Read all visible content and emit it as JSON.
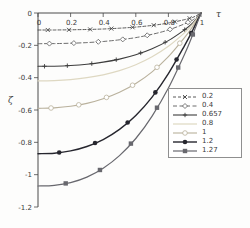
{
  "figure": {
    "background": "#fdfdfc",
    "axis_color": "#4a4a4a"
  },
  "chart_data": {
    "type": "line",
    "title": "",
    "xlabel": "τ",
    "ylabel": "ζ",
    "xlim": [
      0,
      1
    ],
    "ylim": [
      -1.2,
      0
    ],
    "grid": false,
    "legend_position": "lower right inside",
    "xticks": {
      "values": [
        0,
        0.2,
        0.4,
        0.6,
        0.8,
        1
      ],
      "labels": [
        "0",
        "0.2",
        "0.4",
        "0.6",
        "0.8",
        "1"
      ]
    },
    "yticks": {
      "values": [
        0,
        -0.2,
        -0.4,
        -0.6,
        -0.8,
        -1,
        -1.2
      ],
      "labels": [
        "0",
        "-0.2",
        "-0.4",
        "-0.6",
        "-0.8",
        "-1",
        "-1.2"
      ]
    },
    "x": [
      0,
      0.1,
      0.2,
      0.3,
      0.4,
      0.5,
      0.6,
      0.7,
      0.8,
      0.9,
      0.95,
      1
    ],
    "series": [
      {
        "name": "0.2",
        "label": "0.2",
        "color": "#474747",
        "dash": "3,2",
        "line_width": 0.9,
        "marker": "x",
        "marker_size": 2.0,
        "marker_x": [
          0.06,
          0.19,
          0.32,
          0.45,
          0.58,
          0.71,
          0.84,
          0.93
        ],
        "values": [
          -0.105,
          -0.105,
          -0.104,
          -0.102,
          -0.099,
          -0.094,
          -0.087,
          -0.077,
          -0.062,
          -0.041,
          -0.027,
          0
        ]
      },
      {
        "name": "0.4",
        "label": "0.4",
        "color": "#5c5c5c",
        "dash": "4,2.5",
        "line_width": 0.9,
        "marker": "diamond-open",
        "marker_size": 2.5,
        "marker_x": [
          0.07,
          0.22,
          0.37,
          0.52,
          0.67,
          0.81,
          0.92
        ],
        "values": [
          -0.19,
          -0.189,
          -0.187,
          -0.183,
          -0.176,
          -0.166,
          -0.152,
          -0.132,
          -0.105,
          -0.067,
          -0.043,
          0
        ]
      },
      {
        "name": "0.657",
        "label": "0.657",
        "color": "#3d3d3d",
        "dash": "",
        "line_width": 1.1,
        "marker": "plus",
        "marker_size": 2.2,
        "marker_x": [
          0.04,
          0.18,
          0.33,
          0.48,
          0.63,
          0.78,
          0.9
        ],
        "values": [
          -0.33,
          -0.329,
          -0.325,
          -0.317,
          -0.304,
          -0.285,
          -0.258,
          -0.221,
          -0.171,
          -0.103,
          -0.061,
          0
        ]
      },
      {
        "name": "0.8",
        "label": "0.8",
        "color": "#ded8c2",
        "dash": "",
        "line_width": 1.2,
        "marker": "none",
        "marker_size": 0,
        "marker_x": [],
        "values": [
          -0.42,
          -0.418,
          -0.412,
          -0.4,
          -0.382,
          -0.356,
          -0.32,
          -0.271,
          -0.206,
          -0.121,
          -0.069,
          0
        ]
      },
      {
        "name": "1",
        "label": "1",
        "color": "#b9b19c",
        "dash": "",
        "line_width": 1.1,
        "marker": "circle-open",
        "marker_size": 2.3,
        "marker_x": [
          0.08,
          0.25,
          0.42,
          0.58,
          0.73,
          0.87
        ],
        "values": [
          -0.59,
          -0.587,
          -0.577,
          -0.559,
          -0.53,
          -0.49,
          -0.436,
          -0.364,
          -0.27,
          -0.151,
          -0.083,
          0
        ]
      },
      {
        "name": "1.2",
        "label": "1.2",
        "color": "#26262e",
        "dash": "",
        "line_width": 1.4,
        "marker": "circle-filled",
        "marker_size": 2.3,
        "marker_x": [
          0.13,
          0.35,
          0.55,
          0.72,
          0.85,
          0.94
        ],
        "values": [
          -0.87,
          -0.867,
          -0.853,
          -0.826,
          -0.783,
          -0.72,
          -0.634,
          -0.52,
          -0.375,
          -0.2,
          -0.105,
          0
        ]
      },
      {
        "name": "1.27",
        "label": "1.27",
        "color": "#68686e",
        "dash": "",
        "line_width": 1.2,
        "marker": "square-filled",
        "marker_size": 2.2,
        "marker_x": [
          0.17,
          0.38,
          0.57,
          0.73,
          0.86,
          0.95
        ],
        "values": [
          -1.07,
          -1.066,
          -1.049,
          -1.015,
          -0.96,
          -0.882,
          -0.776,
          -0.638,
          -0.464,
          -0.253,
          -0.133,
          0
        ]
      }
    ]
  }
}
